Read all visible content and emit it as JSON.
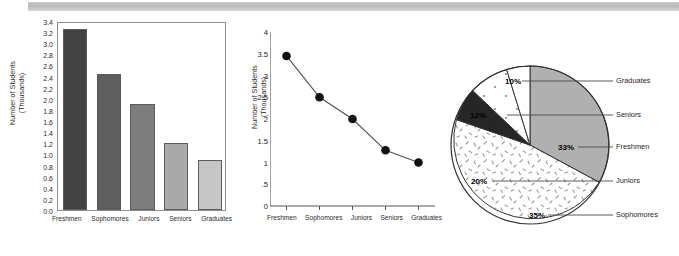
{
  "chart_data": [
    {
      "type": "bar",
      "title": "",
      "xlabel": "",
      "ylabel": "Number of Students\n(Thousands)",
      "ylabel_line1": "Number of Students",
      "ylabel_line2": "(Thousands)",
      "categories": [
        "Freshmen",
        "Sophomores",
        "Juniors",
        "Seniors",
        "Graduates"
      ],
      "values": [
        3.25,
        2.45,
        1.9,
        1.2,
        0.9
      ],
      "ylim": [
        0.0,
        3.4
      ],
      "ytick_labels": [
        "3.4",
        "3.2",
        "3.0",
        "2.8",
        "2.6",
        "2.4",
        "2.2",
        "2.0",
        "1.8",
        "1.6",
        "1.4",
        "1.2",
        "1.0",
        "0.8",
        "0.6",
        "0.4",
        "0.2",
        "0.0"
      ],
      "bar_colors": [
        "#424242",
        "#5e5e5e",
        "#7d7d7d",
        "#a9a9a9",
        "#c6c6c6"
      ],
      "grid": false,
      "legend": "none"
    },
    {
      "type": "line",
      "title": "",
      "xlabel": "",
      "ylabel": "Number of Students\n(Thousands)",
      "ylabel_line1": "Number of Students",
      "ylabel_line2": "(Thousands)",
      "x": [
        "Freshmen",
        "Sophomores",
        "Juniors",
        "Seniors",
        "Graduates"
      ],
      "values": [
        3.45,
        2.5,
        2.0,
        1.28,
        1.0
      ],
      "ylim": [
        0,
        4
      ],
      "ytick_labels": [
        "4",
        "3.5",
        "3",
        "2.5",
        "2",
        "1.5",
        "1",
        ".5",
        "0"
      ],
      "marker": "filled-circle",
      "line_color": "#555555",
      "marker_color": "#111111",
      "grid": false,
      "legend": "none"
    },
    {
      "type": "pie",
      "title": "",
      "start_angle_clock": "12-oclock",
      "direction": "clockwise",
      "labels": [
        "Freshmen",
        "Sophomores",
        "Juniors",
        "Seniors",
        "Graduates"
      ],
      "values": [
        33,
        35,
        20,
        12,
        10
      ],
      "value_labels": [
        "33%",
        "35%",
        "20%",
        "12%",
        "10%"
      ],
      "slice_fills": [
        "solid-gray",
        "white-speckled",
        "solid-black",
        "white-dotted",
        "white-plain"
      ],
      "slice_colors": [
        "#b0b0b0",
        "#ffffff",
        "#262626",
        "#ffffff",
        "#ffffff"
      ],
      "legend": "right-callouts",
      "legend_order": [
        "Graduates",
        "Seniors",
        "Freshmen",
        "Juniors",
        "Sophomores"
      ]
    }
  ],
  "bar_chart": {
    "ylabel_line1": "Number of Students",
    "ylabel_line2": "(Thousands)",
    "yticks": [
      "3.4",
      "3.2",
      "3.0",
      "2.8",
      "2.6",
      "2.4",
      "2.2",
      "2.0",
      "1.8",
      "1.6",
      "1.4",
      "1.2",
      "1.0",
      "0.8",
      "0.6",
      "0.4",
      "0.2",
      "0.0"
    ],
    "xlabels": [
      "Freshmen",
      "Sophomores",
      "Juniors",
      "Seniors",
      "Graduates"
    ]
  },
  "line_chart": {
    "ylabel_line1": "Number of Students",
    "ylabel_line2": "(Thousands)",
    "yticks": [
      "4",
      "3.5",
      "3",
      "2.5",
      "2",
      "1.5",
      "1",
      ".5",
      "0"
    ],
    "xlabels": [
      "Freshmen",
      "Sophomores",
      "Juniors",
      "Seniors",
      "Graduates"
    ]
  },
  "pie_chart": {
    "percents": {
      "graduates": "10%",
      "seniors": "12%",
      "freshmen": "33%",
      "juniors": "20%",
      "sophomores": "35%"
    },
    "legend": {
      "graduates": "Graduates",
      "seniors": "Seniors",
      "freshmen": "Freshmen",
      "juniors": "Juniors",
      "sophomores": "Sophomores"
    }
  }
}
